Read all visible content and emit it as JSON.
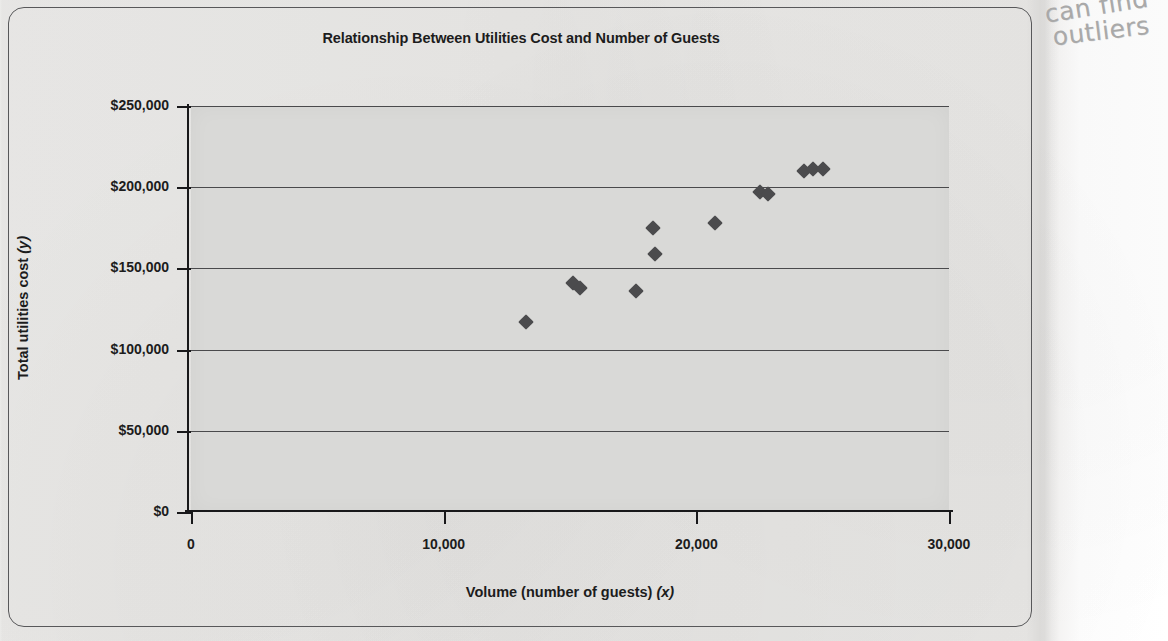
{
  "figure": {
    "title": "Relationship Between Utilities Cost and Number of Guests",
    "x_axis_title_main": "Volume (number of guests)",
    "x_axis_title_var": "(x)",
    "y_axis_title_main": "Total utilities cost",
    "y_axis_title_var": "(y)"
  },
  "annotation": {
    "line1": "can find",
    "line2": "outliers",
    "color": "#a9a9a9"
  },
  "colors": {
    "plot_background": "#d9d9d7",
    "page_background": "#e9e8e6",
    "marker": "#4b4b4d",
    "axis": "#18181a",
    "gridline": "#4a4a4c",
    "text": "#1c1c1c"
  },
  "chart_data": {
    "type": "scatter",
    "title": "Relationship Between Utilities Cost and Number of Guests",
    "xlabel": "Volume (number of guests) (x)",
    "ylabel": "Total utilities cost (y)",
    "xlim": [
      0,
      30000
    ],
    "ylim": [
      0,
      250000
    ],
    "xticks": [
      0,
      10000,
      20000,
      30000
    ],
    "xtick_labels": [
      "0",
      "10,000",
      "20,000",
      "30,000"
    ],
    "yticks": [
      0,
      50000,
      100000,
      150000,
      200000,
      250000
    ],
    "ytick_labels": [
      "$0",
      "$50,000",
      "$100,000",
      "$150,000",
      "$200,000",
      "$250,000"
    ],
    "grid": "horizontal",
    "legend": "none",
    "marker": "diamond",
    "series": [
      {
        "name": "Monthly observations",
        "points": [
          {
            "x": 13250,
            "y": 117000
          },
          {
            "x": 15100,
            "y": 141000
          },
          {
            "x": 15400,
            "y": 138000
          },
          {
            "x": 17600,
            "y": 136000
          },
          {
            "x": 18300,
            "y": 175000
          },
          {
            "x": 18350,
            "y": 159000
          },
          {
            "x": 20750,
            "y": 178000
          },
          {
            "x": 22500,
            "y": 197000
          },
          {
            "x": 22850,
            "y": 196000
          },
          {
            "x": 24250,
            "y": 210000
          },
          {
            "x": 24600,
            "y": 211000
          },
          {
            "x": 25000,
            "y": 211000
          }
        ]
      }
    ]
  }
}
